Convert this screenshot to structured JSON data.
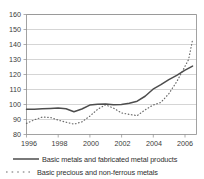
{
  "chart_data": {
    "type": "line",
    "title": "",
    "xlabel": "",
    "ylabel": "",
    "ylim": [
      80,
      160
    ],
    "xlim": [
      1996,
      2006.75
    ],
    "ytick_labels": [
      "160",
      "150",
      "140",
      "130",
      "120",
      "110",
      "100",
      "90",
      "80"
    ],
    "ytick_values": [
      160,
      150,
      140,
      130,
      120,
      110,
      100,
      90,
      80
    ],
    "xtick_labels": [
      "1996",
      "1998",
      "2000",
      "2002",
      "2004",
      "2006"
    ],
    "xtick_values": [
      1996,
      1998,
      2000,
      2002,
      2004,
      2006
    ],
    "grid": true,
    "legend_position": "bottom",
    "series": [
      {
        "name": "Basic metals and fabricated metal products",
        "style": "solid",
        "color": "#4d4d4d",
        "x": [
          1996.0,
          1996.5,
          1997.0,
          1997.5,
          1998.0,
          1998.5,
          1999.0,
          1999.5,
          2000.0,
          2000.5,
          2001.0,
          2001.5,
          2002.0,
          2002.5,
          2003.0,
          2003.5,
          2004.0,
          2004.5,
          2005.0,
          2005.5,
          2006.0,
          2006.5
        ],
        "values": [
          96.8,
          96.9,
          97.2,
          97.4,
          97.6,
          97.2,
          95.2,
          97.0,
          99.6,
          100.2,
          100.4,
          99.8,
          100.0,
          100.8,
          102.2,
          105.5,
          110.2,
          113.2,
          116.6,
          119.4,
          122.8,
          125.6
        ]
      },
      {
        "name": "Basic precious and non-ferrous metals",
        "style": "dotted",
        "color": "#6b6b6b",
        "x": [
          1996.0,
          1996.5,
          1997.0,
          1997.5,
          1998.0,
          1998.5,
          1999.0,
          1999.5,
          2000.0,
          2000.5,
          2001.0,
          2001.5,
          2002.0,
          2002.5,
          2003.0,
          2003.5,
          2004.0,
          2004.5,
          2005.0,
          2005.5,
          2006.0,
          2006.25,
          2006.5
        ],
        "values": [
          87.4,
          89.8,
          91.6,
          91.4,
          89.6,
          88.2,
          86.9,
          88.4,
          92.2,
          96.8,
          99.8,
          97.6,
          94.4,
          93.4,
          92.6,
          96.4,
          99.6,
          101.4,
          107.2,
          115.2,
          125.0,
          130.0,
          143.0
        ]
      }
    ],
    "annotations": []
  },
  "legend": {
    "items": [
      {
        "label": "Basic metals and fabricated metal products",
        "style": "solid"
      },
      {
        "label": "Basic precious and non-ferrous metals",
        "style": "dotted"
      }
    ]
  },
  "axes": {
    "y_label_160": "160",
    "y_label_150": "150",
    "y_label_140": "140",
    "y_label_130": "130",
    "y_label_120": "120",
    "y_label_110": "110",
    "y_label_100": "100",
    "y_label_90": "90",
    "y_label_80": "80",
    "x_label_1996": "1996",
    "x_label_1998": "1998",
    "x_label_2000": "2000",
    "x_label_2002": "2002",
    "x_label_2004": "2004",
    "x_label_2006": "2006"
  }
}
